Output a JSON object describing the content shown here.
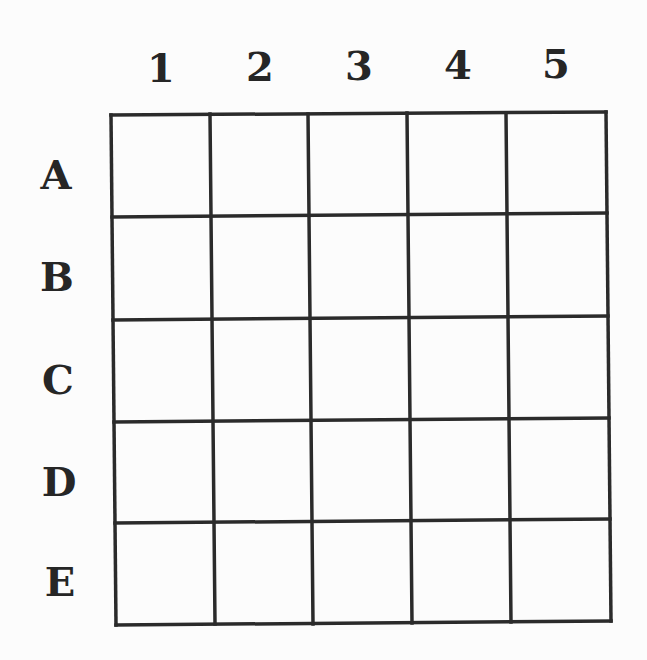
{
  "grid": {
    "columns": [
      "1",
      "2",
      "3",
      "4",
      "5"
    ],
    "rows": [
      "A",
      "B",
      "C",
      "D",
      "E"
    ],
    "line_color": "#2b2b2b",
    "cells": [
      [
        "",
        "",
        "",
        "",
        ""
      ],
      [
        "",
        "",
        "",
        "",
        ""
      ],
      [
        "",
        "",
        "",
        "",
        ""
      ],
      [
        "",
        "",
        "",
        "",
        ""
      ],
      [
        "",
        "",
        "",
        "",
        ""
      ]
    ]
  }
}
